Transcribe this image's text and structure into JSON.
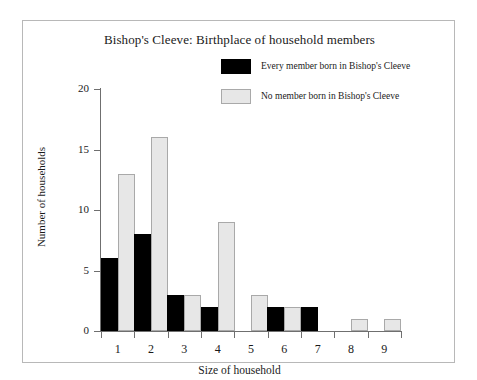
{
  "chart_data": {
    "type": "bar",
    "title": "Bishop's Cleeve: Birthplace of household members",
    "xlabel": "Size of household",
    "ylabel": "Number of households",
    "categories": [
      "1",
      "2",
      "3",
      "4",
      "5",
      "6",
      "7",
      "8",
      "9"
    ],
    "series": [
      {
        "name": "Every member born in Bishop's Cleeve",
        "color": "#000000",
        "values": [
          6,
          8,
          3,
          2,
          0,
          2,
          2,
          0,
          0
        ]
      },
      {
        "name": "No member born in Bishop's Cleeve",
        "color": "#e7e7e7",
        "values": [
          13,
          16,
          3,
          9,
          3,
          2,
          0,
          1,
          1
        ]
      }
    ],
    "ylim": [
      0,
      20
    ],
    "yticks": [
      0,
      5,
      10,
      15,
      20
    ],
    "ytick_labels": [
      "0",
      "5",
      "10",
      "15",
      "20"
    ],
    "grid": false,
    "legend_position": "upper right"
  }
}
